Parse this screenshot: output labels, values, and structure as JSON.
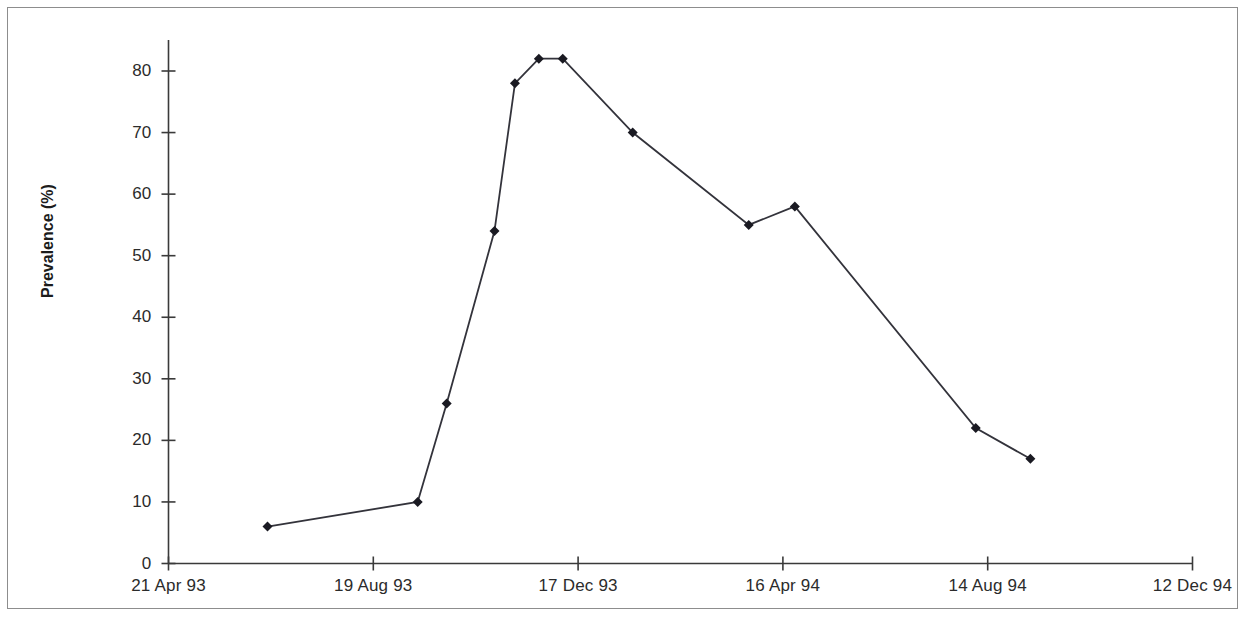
{
  "chart_data": {
    "type": "line",
    "title": "",
    "subtitle": "",
    "xlabel": "",
    "ylabel": "Prevalence (%)",
    "ylim": [
      0,
      85
    ],
    "yticks": [
      0,
      10,
      20,
      30,
      40,
      50,
      60,
      70,
      80
    ],
    "ytick_labels": [
      "0",
      "10",
      "20",
      "30",
      "40",
      "50",
      "60",
      "70",
      "80"
    ],
    "xtick_labels": [
      "21 Apr 93",
      "19 Aug 93",
      "17 Dec 93",
      "16 Apr 94",
      "14 Aug 94",
      "12 Dec 94"
    ],
    "xtick_positions": [
      0,
      120,
      240,
      360,
      480,
      600
    ],
    "xlim": [
      0,
      600
    ],
    "grid": false,
    "legend": null,
    "marker": "diamond",
    "line_color": "#33333b",
    "marker_color": "#1a1a22",
    "series": [
      {
        "name": "Prevalence",
        "x_days": [
          58,
          146,
          163,
          191,
          203,
          217,
          231,
          272,
          340,
          367,
          473,
          505
        ],
        "x_labels": [
          "18 Jun 93",
          "14 Sep 93",
          "1 Oct 93",
          "29 Oct 93",
          "10 Nov 93",
          "24 Nov 93",
          "8 Dec 93",
          "18 Jan 94",
          "27 Mar 94",
          "23 Apr 94",
          "7 Aug 94",
          "8 Sep 94"
        ],
        "values": [
          6,
          10,
          26,
          54,
          78,
          82,
          82,
          70,
          55,
          58,
          22,
          17
        ]
      }
    ]
  },
  "axis": {
    "y_label_text": "Prevalence (%)"
  },
  "colors": {
    "frame": "#8d8d8d",
    "axis": "#3a3a3a",
    "line": "#33333b",
    "marker": "#1a1a22",
    "text": "#2b2b2b",
    "background": "#ffffff"
  }
}
